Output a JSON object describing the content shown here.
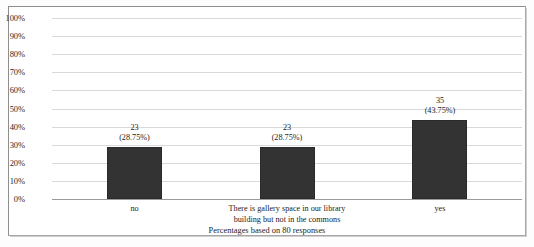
{
  "chart_data": {
    "type": "bar",
    "title": "",
    "subtitle": "",
    "xlabel": "",
    "ylabel": "",
    "categories": [
      "no",
      "There is gallery space in our library building but not in the commons",
      "yes"
    ],
    "values": [
      28.75,
      28.75,
      43.75
    ],
    "counts": [
      23,
      23,
      35
    ],
    "count_labels": [
      "23",
      "23",
      "35"
    ],
    "percent_labels": [
      "(28.75%)",
      "(28.75%)",
      "(43.75%)"
    ],
    "ylim": [
      0,
      100
    ],
    "y_ticks": [
      100,
      90,
      80,
      70,
      60,
      50,
      40,
      30,
      20,
      10,
      0
    ],
    "y_tick_labels": [
      "100%",
      "90%",
      "80%",
      "70%",
      "60%",
      "50%",
      "40%",
      "30%",
      "20%",
      "10%",
      "0%"
    ],
    "grid": true,
    "legend": "none",
    "annotation": "Percentages based on 80 responses",
    "total_responses": 80,
    "bar_color": "#333333",
    "gridline_color": "#d9d9d9",
    "axis_color": "#9a9a9a"
  },
  "category_lines": {
    "cat0": [
      "no"
    ],
    "cat1": [
      "There is gallery space in our library",
      "building but not in the commons"
    ],
    "cat2": [
      "yes"
    ]
  },
  "footnote": {
    "text": "Percentages based on 80 responses"
  }
}
